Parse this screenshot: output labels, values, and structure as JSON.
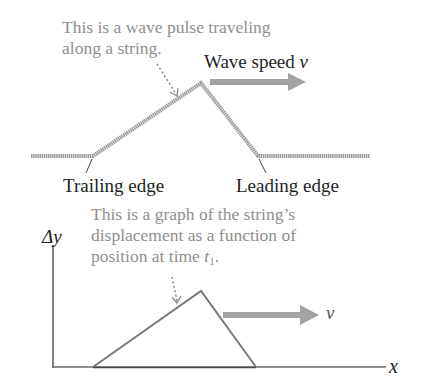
{
  "top_panel": {
    "caption_line1": "This is a wave pulse traveling",
    "caption_line2": "along a string.",
    "speed_label_text": "Wave speed ",
    "speed_label_var": "v",
    "trailing_label": "Trailing edge",
    "leading_label": "Leading edge"
  },
  "bottom_panel": {
    "caption_line1": "This is a graph of the string’s",
    "caption_line2": "displacement as a function of",
    "caption_line3_text": "position at time ",
    "caption_line3_var": "t",
    "caption_line3_sub": "1",
    "caption_line3_end": ".",
    "y_axis_label": "Δy",
    "x_axis_label": "x",
    "velocity_label": "v"
  },
  "colors": {
    "string": "#9a9a9a",
    "arrow": "#a3a3a3",
    "graph_line": "#7a7a7a",
    "axis": "#5a5a5a",
    "caption": "#8f8f8f",
    "label": "#1e1e1e"
  }
}
